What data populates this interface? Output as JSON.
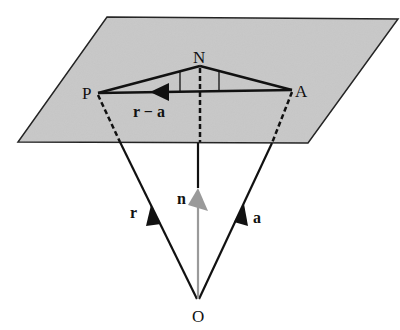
{
  "diagram": {
    "type": "vector-geometry",
    "colors": {
      "plane_fill": "#c8c8c8",
      "line": "#111111",
      "normal_vector": "#9a9a9a",
      "background": "#ffffff"
    },
    "points": {
      "P": "P",
      "N": "N",
      "A": "A",
      "O": "O"
    },
    "vectors": {
      "r": "r",
      "a": "a",
      "n": "n",
      "r_minus_a": "r − a"
    }
  }
}
